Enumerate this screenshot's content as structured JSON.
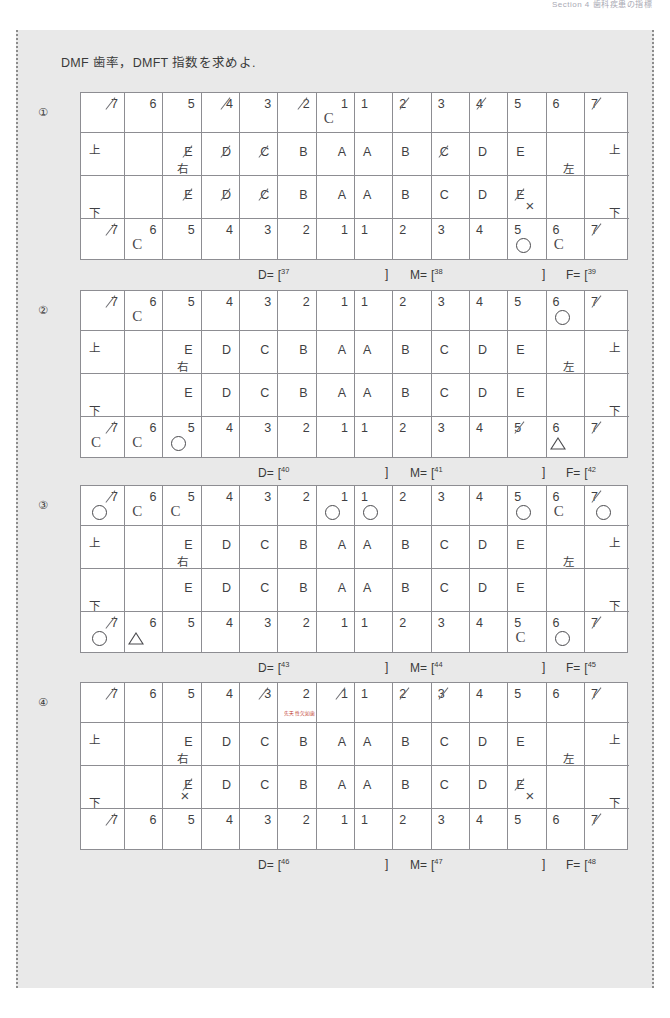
{
  "running_header": "Section 4  歯科疾患の指標",
  "panel": {
    "title": "DMF 歯率，DMFT 指数を求めよ."
  },
  "side_labels": {
    "upper": "上",
    "lower": "下",
    "right": "右",
    "left": "左"
  },
  "answer_labels": {
    "d": "D=",
    "m": "M=",
    "f": "F=",
    "open": "[",
    "close": "]"
  },
  "red_note": "先天性欠如歯",
  "charts": [
    {
      "index": "①",
      "perm_top": [
        "7",
        "6",
        "5",
        "4",
        "3",
        "2",
        "1",
        "1",
        "2",
        "3",
        "4",
        "5",
        "6",
        "7"
      ],
      "perm_top_slash": [
        true,
        false,
        false,
        true,
        false,
        true,
        false,
        false,
        true,
        false,
        true,
        false,
        false,
        true
      ],
      "perm_top_marks": [
        "",
        "",
        "",
        "",
        "",
        "",
        "C",
        "",
        "",
        "",
        "",
        "",
        "",
        ""
      ],
      "dec_top": [
        "",
        "",
        "E",
        "D",
        "C",
        "B",
        "A",
        "A",
        "B",
        "C",
        "D",
        "E",
        "",
        ""
      ],
      "dec_top_slash": [
        false,
        false,
        true,
        true,
        true,
        false,
        false,
        false,
        false,
        true,
        false,
        false,
        false,
        false
      ],
      "dec_top_marks": [
        "",
        "",
        "",
        "",
        "",
        "",
        "",
        "",
        "",
        "",
        "",
        "",
        "",
        ""
      ],
      "dec_bot": [
        "",
        "",
        "E",
        "D",
        "C",
        "B",
        "A",
        "A",
        "B",
        "C",
        "D",
        "E",
        "",
        ""
      ],
      "dec_bot_slash": [
        false,
        false,
        true,
        true,
        true,
        false,
        false,
        false,
        false,
        false,
        false,
        true,
        false,
        false
      ],
      "dec_bot_marks": [
        "",
        "",
        "",
        "",
        "",
        "",
        "",
        "",
        "",
        "",
        "",
        "X",
        "",
        ""
      ],
      "perm_bot": [
        "7",
        "6",
        "5",
        "4",
        "3",
        "2",
        "1",
        "1",
        "2",
        "3",
        "4",
        "5",
        "6",
        "7"
      ],
      "perm_bot_slash": [
        true,
        false,
        false,
        false,
        false,
        false,
        false,
        false,
        false,
        false,
        false,
        false,
        false,
        true
      ],
      "perm_bot_marks": [
        "",
        "C",
        "",
        "",
        "",
        "",
        "",
        "",
        "",
        "",
        "",
        "O",
        "C",
        ""
      ],
      "answers": {
        "d": "37",
        "m": "38",
        "f": "39"
      }
    },
    {
      "index": "②",
      "perm_top": [
        "7",
        "6",
        "5",
        "4",
        "3",
        "2",
        "1",
        "1",
        "2",
        "3",
        "4",
        "5",
        "6",
        "7"
      ],
      "perm_top_slash": [
        true,
        false,
        false,
        false,
        false,
        false,
        false,
        false,
        false,
        false,
        false,
        false,
        false,
        true
      ],
      "perm_top_marks": [
        "",
        "C",
        "",
        "",
        "",
        "",
        "",
        "",
        "",
        "",
        "",
        "",
        "O",
        ""
      ],
      "dec_top": [
        "",
        "",
        "E",
        "D",
        "C",
        "B",
        "A",
        "A",
        "B",
        "C",
        "D",
        "E",
        "",
        ""
      ],
      "dec_top_slash": [
        false,
        false,
        false,
        false,
        false,
        false,
        false,
        false,
        false,
        false,
        false,
        false,
        false,
        false
      ],
      "dec_top_marks": [
        "",
        "",
        "",
        "",
        "",
        "",
        "",
        "",
        "",
        "",
        "",
        "",
        "",
        ""
      ],
      "dec_bot": [
        "",
        "",
        "E",
        "D",
        "C",
        "B",
        "A",
        "A",
        "B",
        "C",
        "D",
        "E",
        "",
        ""
      ],
      "dec_bot_slash": [
        false,
        false,
        false,
        false,
        false,
        false,
        false,
        false,
        false,
        false,
        false,
        false,
        false,
        false
      ],
      "dec_bot_marks": [
        "",
        "",
        "",
        "",
        "",
        "",
        "",
        "",
        "",
        "",
        "",
        "",
        "",
        ""
      ],
      "perm_bot": [
        "7",
        "6",
        "5",
        "4",
        "3",
        "2",
        "1",
        "1",
        "2",
        "3",
        "4",
        "5",
        "6",
        "7"
      ],
      "perm_bot_slash": [
        true,
        false,
        false,
        false,
        false,
        false,
        false,
        false,
        false,
        false,
        false,
        true,
        false,
        true
      ],
      "perm_bot_marks": [
        "C",
        "C",
        "O",
        "",
        "",
        "",
        "",
        "",
        "",
        "",
        "",
        "",
        "T",
        ""
      ],
      "answers": {
        "d": "40",
        "m": "41",
        "f": "42"
      }
    },
    {
      "index": "③",
      "perm_top": [
        "7",
        "6",
        "5",
        "4",
        "3",
        "2",
        "1",
        "1",
        "2",
        "3",
        "4",
        "5",
        "6",
        "7"
      ],
      "perm_top_slash": [
        true,
        false,
        false,
        false,
        false,
        false,
        false,
        false,
        false,
        false,
        false,
        false,
        false,
        true
      ],
      "perm_top_marks": [
        "O",
        "C",
        "C",
        "",
        "",
        "",
        "O",
        "O",
        "",
        "",
        "",
        "O",
        "C",
        "O"
      ],
      "dec_top": [
        "",
        "",
        "E",
        "D",
        "C",
        "B",
        "A",
        "A",
        "B",
        "C",
        "D",
        "E",
        "",
        ""
      ],
      "dec_top_slash": [
        false,
        false,
        false,
        false,
        false,
        false,
        false,
        false,
        false,
        false,
        false,
        false,
        false,
        false
      ],
      "dec_top_marks": [
        "",
        "",
        "",
        "",
        "",
        "",
        "",
        "",
        "",
        "",
        "",
        "",
        "",
        ""
      ],
      "dec_bot": [
        "",
        "",
        "E",
        "D",
        "C",
        "B",
        "A",
        "A",
        "B",
        "C",
        "D",
        "E",
        "",
        ""
      ],
      "dec_bot_slash": [
        false,
        false,
        false,
        false,
        false,
        false,
        false,
        false,
        false,
        false,
        false,
        false,
        false,
        false
      ],
      "dec_bot_marks": [
        "",
        "",
        "",
        "",
        "",
        "",
        "",
        "",
        "",
        "",
        "",
        "",
        "",
        ""
      ],
      "perm_bot": [
        "7",
        "6",
        "5",
        "4",
        "3",
        "2",
        "1",
        "1",
        "2",
        "3",
        "4",
        "5",
        "6",
        "7"
      ],
      "perm_bot_slash": [
        true,
        false,
        false,
        false,
        false,
        false,
        false,
        false,
        false,
        false,
        false,
        false,
        false,
        true
      ],
      "perm_bot_marks": [
        "O",
        "T",
        "",
        "",
        "",
        "",
        "",
        "",
        "",
        "",
        "",
        "C",
        "O",
        ""
      ],
      "answers": {
        "d": "43",
        "m": "44",
        "f": "45"
      }
    },
    {
      "index": "④",
      "perm_top": [
        "7",
        "6",
        "5",
        "4",
        "3",
        "2",
        "1",
        "1",
        "2",
        "3",
        "4",
        "5",
        "6",
        "7"
      ],
      "perm_top_slash": [
        true,
        false,
        false,
        false,
        true,
        false,
        true,
        false,
        true,
        true,
        false,
        false,
        false,
        true
      ],
      "perm_top_marks": [
        "",
        "",
        "",
        "",
        "",
        "",
        "",
        "",
        "",
        "",
        "",
        "",
        "",
        ""
      ],
      "dec_top": [
        "",
        "",
        "E",
        "D",
        "C",
        "B",
        "A",
        "A",
        "B",
        "C",
        "D",
        "E",
        "",
        ""
      ],
      "dec_top_slash": [
        false,
        false,
        false,
        false,
        false,
        false,
        false,
        false,
        false,
        false,
        false,
        false,
        false,
        false
      ],
      "dec_top_marks": [
        "",
        "",
        "",
        "",
        "",
        "",
        "",
        "",
        "",
        "",
        "",
        "",
        "",
        ""
      ],
      "dec_bot": [
        "",
        "",
        "E",
        "D",
        "C",
        "B",
        "A",
        "A",
        "B",
        "C",
        "D",
        "E",
        "",
        ""
      ],
      "dec_bot_slash": [
        false,
        false,
        true,
        false,
        false,
        false,
        false,
        false,
        false,
        false,
        false,
        true,
        false,
        false
      ],
      "dec_bot_marks": [
        "",
        "",
        "X",
        "",
        "",
        "",
        "",
        "",
        "",
        "",
        "",
        "X",
        "",
        ""
      ],
      "perm_bot": [
        "7",
        "6",
        "5",
        "4",
        "3",
        "2",
        "1",
        "1",
        "2",
        "3",
        "4",
        "5",
        "6",
        "7"
      ],
      "perm_bot_slash": [
        true,
        false,
        false,
        false,
        false,
        false,
        false,
        false,
        false,
        false,
        false,
        false,
        false,
        true
      ],
      "perm_bot_marks": [
        "",
        "",
        "",
        "",
        "",
        "",
        "",
        "",
        "",
        "",
        "",
        "",
        "",
        ""
      ],
      "answers": {
        "d": "46",
        "m": "47",
        "f": "48"
      }
    }
  ]
}
